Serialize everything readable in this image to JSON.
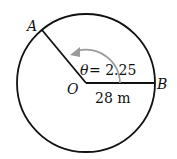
{
  "diagram": {
    "type": "circle-sector",
    "points": {
      "A": "A",
      "B": "B",
      "O": "O"
    },
    "angle_label": "θ = 2.25",
    "angle_symbol": "θ",
    "angle_value": "= 2.25",
    "radius_label": "28 m",
    "colors": {
      "stroke": "#111111",
      "arrow": "#9a9a9a"
    }
  }
}
